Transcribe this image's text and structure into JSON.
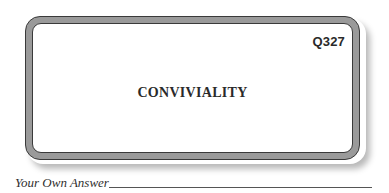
{
  "card": {
    "question_number": "Q327",
    "word": "CONVIVIALITY"
  },
  "answer": {
    "label": "Your Own Answer",
    "value": ""
  },
  "colors": {
    "border_fill": "#9a9a9a",
    "border_outline": "#3a3a3a",
    "text": "#2a2a2a",
    "background": "#ffffff"
  }
}
